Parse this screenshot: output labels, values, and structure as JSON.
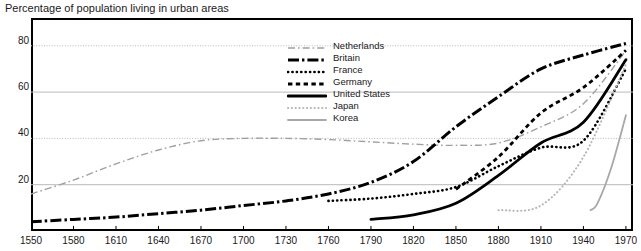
{
  "chart_data": {
    "type": "line",
    "title": "Percentage of population living in urban areas",
    "xlabel": "",
    "ylabel": "",
    "xlim": [
      1550,
      1975
    ],
    "ylim": [
      0,
      92
    ],
    "grid": true,
    "legend_position": "top-center",
    "xticks": [
      1550,
      1580,
      1610,
      1640,
      1670,
      1700,
      1730,
      1760,
      1790,
      1820,
      1850,
      1880,
      1910,
      1940,
      1970
    ],
    "yticks": [
      20,
      40,
      60,
      80
    ],
    "series": [
      {
        "name": "Netherlands",
        "style": "dash-dot-light",
        "color": "#a0a0a0",
        "x": [
          1550,
          1580,
          1610,
          1640,
          1670,
          1700,
          1730,
          1760,
          1790,
          1820,
          1850,
          1880,
          1910,
          1940,
          1970
        ],
        "values": [
          16,
          22,
          29,
          35,
          39,
          40,
          40,
          39.5,
          38.5,
          37.5,
          37,
          38,
          45,
          55,
          78
        ]
      },
      {
        "name": "Britain",
        "style": "dash-dot-bold",
        "color": "#000000",
        "x": [
          1550,
          1580,
          1610,
          1640,
          1670,
          1700,
          1730,
          1760,
          1790,
          1820,
          1850,
          1880,
          1910,
          1940,
          1970
        ],
        "values": [
          4,
          5,
          6,
          7.5,
          9,
          11,
          13,
          16,
          21,
          30,
          45,
          58,
          70,
          76,
          81
        ]
      },
      {
        "name": "France",
        "style": "dotted-fine",
        "color": "#000000",
        "x": [
          1760,
          1790,
          1820,
          1850,
          1880,
          1910,
          1940,
          1970
        ],
        "values": [
          13,
          14,
          16,
          19,
          28,
          36,
          39,
          70
        ]
      },
      {
        "name": "Germany",
        "style": "dashed",
        "color": "#000000",
        "x": [
          1850,
          1880,
          1910,
          1940,
          1970
        ],
        "values": [
          18,
          32,
          51,
          62,
          78
        ]
      },
      {
        "name": "United States",
        "style": "solid-bold",
        "color": "#000000",
        "x": [
          1790,
          1820,
          1850,
          1880,
          1910,
          1940,
          1970
        ],
        "values": [
          5,
          7,
          12,
          24,
          38,
          47,
          74
        ]
      },
      {
        "name": "Japan",
        "style": "dotted-light",
        "color": "#b4b4b4",
        "x": [
          1880,
          1910,
          1940,
          1970
        ],
        "values": [
          9,
          11,
          32,
          72
        ]
      },
      {
        "name": "Korea",
        "style": "solid-light",
        "color": "#a8a8a8",
        "x": [
          1945,
          1950,
          1960,
          1970
        ],
        "values": [
          9,
          12,
          28,
          50
        ]
      }
    ]
  },
  "legend": {
    "items": [
      {
        "label": "Netherlands"
      },
      {
        "label": "Britain"
      },
      {
        "label": "France"
      },
      {
        "label": "Germany"
      },
      {
        "label": "United States"
      },
      {
        "label": "Japan"
      },
      {
        "label": "Korea"
      }
    ]
  },
  "axis": {
    "y_labels": [
      "80",
      "60",
      "40",
      "20"
    ],
    "x_labels": [
      "1550",
      "1580",
      "1610",
      "1640",
      "1670",
      "1700",
      "1730",
      "1760",
      "1790",
      "1820",
      "1850",
      "1880",
      "1910",
      "1940",
      "1970"
    ]
  },
  "colors": {
    "frame": "#000000",
    "gridline": "#b9b9b9",
    "text": "#1a1a1a",
    "background": "#ffffff"
  }
}
